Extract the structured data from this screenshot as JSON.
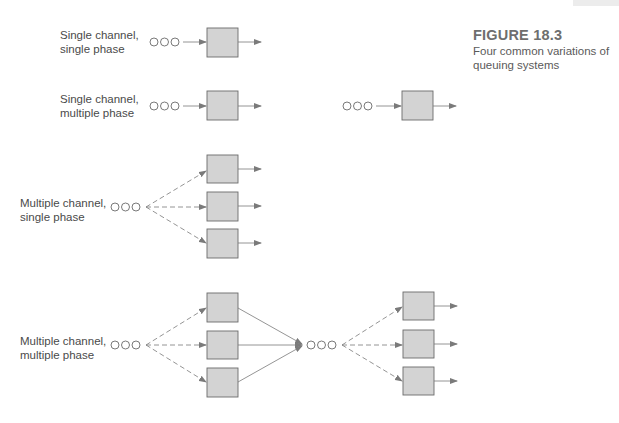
{
  "figure": {
    "number": "FIGURE 18.3",
    "caption": "Four common variations of queuing systems"
  },
  "rows": [
    {
      "label_line1": "Single channel,",
      "label_line2": "single phase"
    },
    {
      "label_line1": "Single channel,",
      "label_line2": "multiple phase"
    },
    {
      "label_line1": "Multiple channel,",
      "label_line2": "single phase"
    },
    {
      "label_line1": "Multiple channel,",
      "label_line2": "multiple phase"
    }
  ],
  "colors": {
    "server_fill": "#d3d3d3",
    "server_stroke": "#6a6a6a",
    "line": "#7a7a7a",
    "text": "#4a4a4a"
  }
}
